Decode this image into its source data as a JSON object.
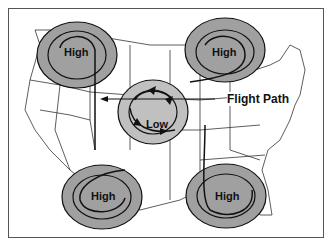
{
  "diagram": {
    "title": "",
    "labels": {
      "high_nw": "High",
      "high_ne": "High",
      "high_sw": "High",
      "high_se": "High",
      "low_center": "Low",
      "flight_path": "Flight Path"
    },
    "colors": {
      "pressure_fill": "#a0a0a0",
      "low_fill": "#c0c0c0",
      "outline": "#111111",
      "map_lines": "#333333"
    }
  }
}
